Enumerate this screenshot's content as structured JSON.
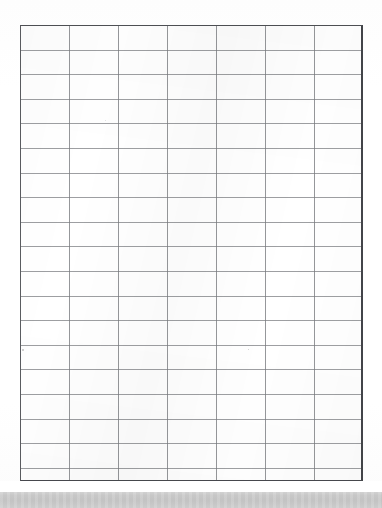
{
  "document": {
    "kind": "scanned-grid-worksheet",
    "title": "Blank grid worksheet",
    "page_background": "#ffffff",
    "text_content": []
  },
  "grid": {
    "name": "blank-grid",
    "columns": 14,
    "rows": 18,
    "cell_width_px": 24.5,
    "cell_height_px": 24.6,
    "left_px": 20,
    "top_px": 25,
    "width_px": 343,
    "height_px": 456,
    "inner_line_color": "#787a7e",
    "border_color": "#4a4c50",
    "border_width_px": 2,
    "fill_color": "#ffffff",
    "cell_labels": []
  },
  "scanbed": {
    "name": "scanner-bed-band",
    "top_px": 492,
    "height_px": 16,
    "color": "#c8c8c8"
  },
  "margins": {
    "left_px": 20,
    "right_px": 19,
    "top_px": 25,
    "bottom_px": 27
  },
  "chart_data": {
    "type": "table",
    "title": "",
    "xlabel": "",
    "ylabel": "",
    "categories": [],
    "values": [],
    "grid": true,
    "legend": "none",
    "note": "Empty 14 x 18 ruled grid; no data plotted, no tick labels, no annotations."
  }
}
